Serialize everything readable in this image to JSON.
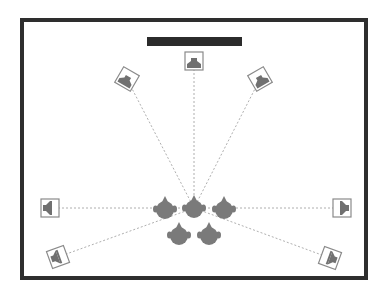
{
  "diagram": {
    "type": "surround-speaker-layout",
    "colors": {
      "frame": "#2e2e2e",
      "screen": "#2b2b2b",
      "speaker_box": "#8a8a8a",
      "speaker_driver": "#707070",
      "listener": "#7a7a7a",
      "line": "#9a9a9a",
      "background": "#ffffff"
    },
    "room": {
      "x": 22,
      "y": 20,
      "width": 344,
      "height": 258,
      "stroke_width": 4
    },
    "screen": {
      "label": "TV / screen",
      "x": 147,
      "y": 37,
      "width": 95,
      "height": 9
    },
    "focus_point": {
      "x": 194,
      "y": 208
    },
    "speakers": [
      {
        "id": "center",
        "label": "Center",
        "cx": 194,
        "cy": 61,
        "rotate": 0,
        "facing": "down"
      },
      {
        "id": "front-left",
        "label": "Front Left",
        "cx": 127,
        "cy": 79,
        "rotate": 30,
        "facing": "down"
      },
      {
        "id": "front-right",
        "label": "Front Right",
        "cx": 260,
        "cy": 79,
        "rotate": -30,
        "facing": "down"
      },
      {
        "id": "side-left",
        "label": "Side Left",
        "cx": 50,
        "cy": 208,
        "rotate": 0,
        "facing": "right"
      },
      {
        "id": "side-right",
        "label": "Side Right",
        "cx": 342,
        "cy": 208,
        "rotate": 0,
        "facing": "left"
      },
      {
        "id": "rear-left",
        "label": "Rear Left",
        "cx": 58,
        "cy": 257,
        "rotate": -20,
        "facing": "right"
      },
      {
        "id": "rear-right",
        "label": "Rear Right",
        "cx": 330,
        "cy": 258,
        "rotate": 20,
        "facing": "left"
      }
    ],
    "listeners": [
      {
        "id": "listener-1",
        "cx": 165,
        "cy": 209
      },
      {
        "id": "listener-2",
        "cx": 194,
        "cy": 208
      },
      {
        "id": "listener-3",
        "cx": 224,
        "cy": 209
      },
      {
        "id": "listener-4",
        "cx": 179,
        "cy": 235
      },
      {
        "id": "listener-5",
        "cx": 209,
        "cy": 235
      }
    ]
  }
}
